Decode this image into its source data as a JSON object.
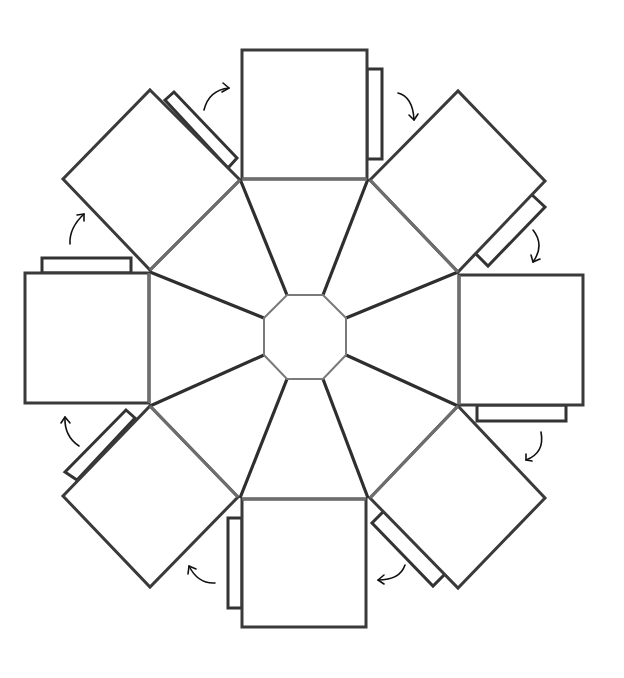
{
  "diagram": {
    "title": "",
    "colors": {
      "background": "#ffffff",
      "outline": "#3a3a3a",
      "fold_line": "#6e6e6e",
      "spoke": "#2e2e2e",
      "octagon": "#7a7a7a",
      "arrow": "#111111"
    },
    "center_octagon": {
      "points": "287,295 323,295 346,318 346,355 323,379 287,379 264,355 264,318"
    },
    "outer_vertices": [
      [
        240,
        179
      ],
      [
        368,
        179
      ],
      [
        458,
        272
      ],
      [
        458,
        406
      ],
      [
        368,
        498
      ],
      [
        240,
        498
      ],
      [
        150,
        406
      ],
      [
        150,
        272
      ]
    ],
    "octagon_vertices": [
      [
        287,
        295
      ],
      [
        323,
        295
      ],
      [
        346,
        318
      ],
      [
        346,
        355
      ],
      [
        323,
        379
      ],
      [
        287,
        379
      ],
      [
        264,
        355
      ],
      [
        264,
        318
      ]
    ],
    "panels": [
      {
        "name": "top",
        "points": "242,50 367,50 367,179 242,179",
        "fold": "242,179 367,179"
      },
      {
        "name": "top-right",
        "points": "370,180 458,91 545,181 458,272",
        "fold": "370,180 458,272"
      },
      {
        "name": "right",
        "points": "459,275 583,275 583,405 459,405",
        "fold": "459,275 459,405"
      },
      {
        "name": "bottom-right",
        "points": "458,406 545,498 458,588 370,498",
        "fold": "458,406 370,498"
      },
      {
        "name": "bottom",
        "points": "242,499 366,499 366,627 242,627",
        "fold": "242,499 366,499"
      },
      {
        "name": "bottom-left",
        "points": "150,406 238,497 150,587 63,496",
        "fold": "150,406 238,497"
      },
      {
        "name": "left",
        "points": "25,273 149,273 149,403 25,403",
        "fold": "149,273 149,403"
      },
      {
        "name": "top-left",
        "points": "150,90 240,180 150,270 63,179",
        "fold": "240,180 150,270"
      }
    ],
    "tabs": [
      {
        "name": "top",
        "points": "367,69 382,69 382,159 367,159"
      },
      {
        "name": "top-right",
        "points": "530,193 545,207 488,266 474,252"
      },
      {
        "name": "right",
        "points": "477,405 566,405 566,421 477,421"
      },
      {
        "name": "bottom-right",
        "points": "384,511 445,574 433,586 372,523"
      },
      {
        "name": "bottom",
        "points": "228,518 242,518 242,608 228,608"
      },
      {
        "name": "bottom-left",
        "points": "126,410 135,418 77,480 65,472"
      },
      {
        "name": "left",
        "points": "42,258 131,258 131,273 42,273"
      },
      {
        "name": "top-left",
        "points": "165,100 174,92 237,158 228,168"
      }
    ],
    "arrows": [
      {
        "name": "arrow-1",
        "path": "M204,110 Q209,90 229,88",
        "head": "M223,83 L229,88 L222,92"
      },
      {
        "name": "arrow-2",
        "path": "M398,93 Q413,97 414,120",
        "head": "M409,115 L414,120 L418,114"
      },
      {
        "name": "arrow-3",
        "path": "M533,230 Q545,245 533,262",
        "head": "M531,255 L533,262 L540,259"
      },
      {
        "name": "arrow-4",
        "path": "M541,432 Q545,453 526,460",
        "head": "M526,454 L526,460 L532,461"
      },
      {
        "name": "arrow-5",
        "path": "M405,565 Q400,580 378,580",
        "head": "M384,575 L378,580 L384,584"
      },
      {
        "name": "arrow-6",
        "path": "M215,583 Q198,584 189,566",
        "head": "M188,574 L189,566 L196,569"
      },
      {
        "name": "arrow-7",
        "path": "M79,446 Q64,436 65,417",
        "head": "M61,423 L65,417 L70,423"
      },
      {
        "name": "arrow-8",
        "path": "M70,244 Q69,228 84,214",
        "head": "M77,215 L84,214 L84,221"
      }
    ]
  }
}
